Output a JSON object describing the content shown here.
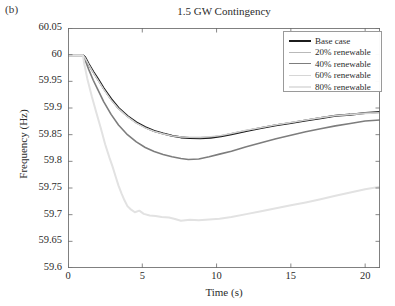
{
  "panel": {
    "label": "(b)"
  },
  "chart_data": {
    "type": "line",
    "title": "1.5 GW Contingency",
    "xlabel": "Time (s)",
    "ylabel": "Frequency (Hz)",
    "xlim": [
      0,
      21
    ],
    "ylim": [
      59.6,
      60.05
    ],
    "xticks": [
      0,
      5,
      10,
      15,
      20
    ],
    "xtick_labels": [
      "0",
      "5",
      "10",
      "15",
      "20"
    ],
    "yticks": [
      59.6,
      59.65,
      59.7,
      59.75,
      59.8,
      59.85,
      59.9,
      59.95,
      60,
      60.05
    ],
    "ytick_labels": [
      "59.6",
      "59.65",
      "59.7",
      "59.75",
      "59.8",
      "59.85",
      "59.9",
      "59.95",
      "60",
      "60.05"
    ],
    "grid": false,
    "legend_position": "upper right",
    "event_time_s": 1.0,
    "series": [
      {
        "name": "Base case",
        "color": "#1c1c1c",
        "width": 2.1,
        "nadir": 59.8435,
        "nadir_time_s": 8.9,
        "final_value": 59.8925,
        "x": [
          0,
          0.5,
          1,
          1.15,
          1.4,
          1.7,
          2,
          2.4,
          2.9,
          3.4,
          4,
          4.6,
          5.2,
          5.8,
          6.4,
          7,
          7.6,
          8.2,
          8.9,
          9.6,
          10.3,
          11,
          12,
          13,
          14,
          15,
          16,
          17,
          18,
          19,
          20,
          21
        ],
        "y": [
          59.999,
          59.999,
          59.999,
          59.995,
          59.982,
          59.968,
          59.955,
          59.937,
          59.917,
          59.9,
          59.885,
          59.873,
          59.864,
          59.857,
          59.852,
          59.848,
          59.845,
          59.8438,
          59.8435,
          59.8445,
          59.847,
          59.851,
          59.857,
          59.8625,
          59.8675,
          59.872,
          59.8765,
          59.881,
          59.8855,
          59.8875,
          59.8905,
          59.8925
        ]
      },
      {
        "name": "20% renewable",
        "color": "#b9b9b9",
        "width": 1.1,
        "nadir": 59.8445,
        "nadir_time_s": 8.9,
        "final_value": 59.8915,
        "x": [
          0,
          0.5,
          1,
          1.15,
          1.4,
          1.7,
          2,
          2.4,
          2.9,
          3.4,
          4,
          4.6,
          5.2,
          5.8,
          6.4,
          7,
          7.6,
          8.2,
          8.9,
          9.6,
          10.3,
          11,
          12,
          13,
          14,
          15,
          16,
          17,
          18,
          19,
          20,
          21
        ],
        "y": [
          59.999,
          59.999,
          59.999,
          59.994,
          59.981,
          59.9665,
          59.9535,
          59.9355,
          59.9155,
          59.899,
          59.884,
          59.872,
          59.863,
          59.8565,
          59.8515,
          59.8475,
          59.8452,
          59.8446,
          59.8445,
          59.8455,
          59.848,
          59.852,
          59.858,
          59.863,
          59.868,
          59.8725,
          59.877,
          59.8815,
          59.886,
          59.888,
          59.891,
          59.8915
        ]
      },
      {
        "name": "40% renewable",
        "color": "#7d7d7d",
        "width": 1.6,
        "nadir": 59.8035,
        "nadir_time_s": 8.1,
        "final_value": 59.8775,
        "x": [
          0,
          0.5,
          1,
          1.15,
          1.4,
          1.7,
          2,
          2.4,
          2.9,
          3.4,
          4,
          4.6,
          5.2,
          5.8,
          6.4,
          7,
          7.6,
          8.1,
          8.8,
          9.5,
          10.2,
          11,
          12,
          13,
          14,
          15,
          16,
          17,
          18,
          19,
          20,
          21
        ],
        "y": [
          59.999,
          59.999,
          59.999,
          59.99,
          59.972,
          59.952,
          59.935,
          59.912,
          59.888,
          59.868,
          59.85,
          59.8365,
          59.826,
          59.8185,
          59.813,
          59.8085,
          59.8053,
          59.8035,
          59.8045,
          59.8085,
          59.8135,
          59.819,
          59.8275,
          59.835,
          59.8425,
          59.849,
          59.8555,
          59.861,
          59.8665,
          59.871,
          59.8755,
          59.8775
        ]
      },
      {
        "name": "60% renewable",
        "color": "#d6d6d6",
        "width": 1.1,
        "nadir": 59.8455,
        "nadir_time_s": 8.9,
        "final_value": 59.8905,
        "x": [
          0,
          0.5,
          1,
          1.15,
          1.4,
          1.7,
          2,
          2.4,
          2.9,
          3.4,
          4,
          4.6,
          5.2,
          5.8,
          6.4,
          7,
          7.6,
          8.2,
          8.9,
          9.6,
          10.3,
          11,
          12,
          13,
          14,
          15,
          16,
          17,
          18,
          19,
          20,
          21
        ],
        "y": [
          59.999,
          59.999,
          59.999,
          59.9935,
          59.9805,
          59.966,
          59.953,
          59.935,
          59.915,
          59.8985,
          59.8835,
          59.8715,
          59.8625,
          59.856,
          59.8515,
          59.848,
          59.846,
          59.8456,
          59.8455,
          59.8465,
          59.849,
          59.8525,
          59.8585,
          59.8635,
          59.8685,
          59.873,
          59.8775,
          59.882,
          59.8855,
          59.8875,
          59.8895,
          59.8905
        ]
      },
      {
        "name": "80% renewable",
        "color": "#e2e2e2",
        "width": 2.0,
        "nadir": 59.6885,
        "nadir_time_s": 7.6,
        "final_value": 59.7525,
        "x": [
          0,
          0.5,
          1,
          1.1,
          1.3,
          1.6,
          1.9,
          2.2,
          2.5,
          2.8,
          3.0,
          3.2,
          3.4,
          3.6,
          3.8,
          4.0,
          4.2,
          4.5,
          4.8,
          5.1,
          5.5,
          5.9,
          6.3,
          6.8,
          7.2,
          7.6,
          8.2,
          8.8,
          9.5,
          10.2,
          11,
          12,
          13,
          14,
          15,
          16,
          17,
          18,
          19,
          20,
          21
        ],
        "y": [
          59.999,
          59.999,
          59.999,
          59.982,
          59.955,
          59.922,
          59.892,
          59.863,
          59.832,
          59.806,
          59.79,
          59.772,
          59.7545,
          59.74,
          59.727,
          59.716,
          59.7105,
          59.7045,
          59.7075,
          59.7015,
          59.6985,
          59.6975,
          59.6955,
          59.6945,
          59.692,
          59.6885,
          59.6905,
          59.6895,
          59.691,
          59.6925,
          59.6955,
          59.701,
          59.7065,
          59.712,
          59.7175,
          59.723,
          59.729,
          59.7355,
          59.7415,
          59.7475,
          59.7525
        ]
      }
    ]
  }
}
